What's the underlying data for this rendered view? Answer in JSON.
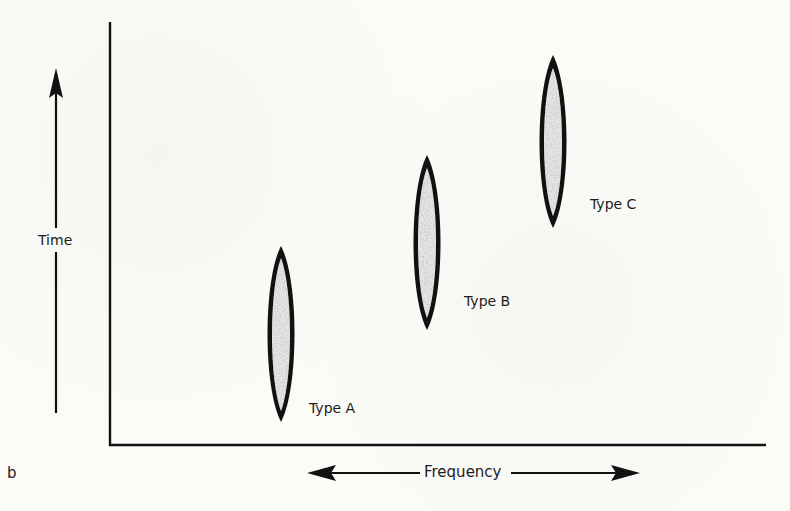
{
  "figure": {
    "panel_letter": "b",
    "y_axis_label": "Time",
    "x_axis_label": "Frequency",
    "y_axis_direction": "up",
    "x_axis_direction": "both"
  },
  "types": [
    {
      "label": "Type A",
      "frequency_rank": 1,
      "time_rank": 1
    },
    {
      "label": "Type B",
      "frequency_rank": 2,
      "time_rank": 2
    },
    {
      "label": "Type C",
      "frequency_rank": 3,
      "time_rank": 3
    }
  ],
  "colors": {
    "ink": "#111111",
    "fill_speckle": "#bdbdbd",
    "background": "#fbfbf8"
  }
}
